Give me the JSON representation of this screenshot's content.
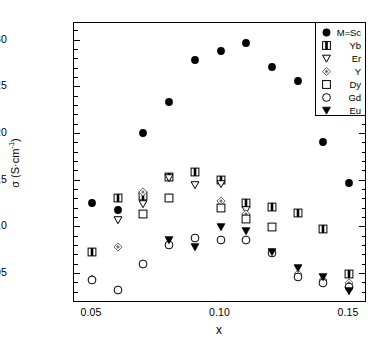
{
  "chart_data": {
    "type": "scatter",
    "title": "",
    "xlabel": "x",
    "ylabel": "σ (S·cm⁻¹)",
    "xlim": [
      0.043,
      0.157
    ],
    "ylim": [
      0.018,
      0.318
    ],
    "xticks": [
      0.05,
      0.1,
      0.15
    ],
    "xticklabels": [
      "0.05",
      "0.10",
      "0.15"
    ],
    "xminor_step": 0.01,
    "yticks": [
      0.05,
      0.1,
      0.15,
      0.2,
      0.25,
      0.3
    ],
    "yticklabels": [
      "0.05",
      "0.10",
      "0.15",
      "0.20",
      "0.25",
      "0.30"
    ],
    "yminor_step": 0.01,
    "grid": false,
    "legend_position": "top-right",
    "series": [
      {
        "name": "M=Sc",
        "marker": "filled-circle",
        "color": "#000000",
        "x": [
          0.05,
          0.06,
          0.07,
          0.08,
          0.09,
          0.1,
          0.11,
          0.12,
          0.13,
          0.14,
          0.15
        ],
        "y": [
          0.125,
          0.118,
          0.2,
          0.233,
          0.278,
          0.288,
          0.297,
          0.271,
          0.256,
          0.19,
          0.147
        ]
      },
      {
        "name": "Yb",
        "marker": "half-filled-square",
        "color": "#000000",
        "x": [
          0.05,
          0.06,
          0.07,
          0.08,
          0.09,
          0.1,
          0.11,
          0.12,
          0.13,
          0.14,
          0.15
        ],
        "y": [
          0.073,
          0.131,
          0.133,
          0.153,
          0.158,
          0.15,
          0.125,
          0.121,
          0.114,
          0.097,
          0.049
        ]
      },
      {
        "name": "Er",
        "marker": "open-triangle-down",
        "color": "#000000",
        "x": [
          0.06,
          0.07,
          0.08,
          0.09,
          0.1,
          0.11
        ],
        "y": [
          0.107,
          0.124,
          0.152,
          0.144,
          0.145,
          0.118
        ]
      },
      {
        "name": "Y",
        "marker": "dotted-diamond",
        "color": "#000000",
        "x": [
          0.05,
          0.06,
          0.07,
          0.08,
          0.1,
          0.11,
          0.13,
          0.14,
          0.15
        ],
        "y": [
          0.044,
          0.078,
          0.137,
          0.131,
          0.127,
          0.113,
          0.049,
          0.043,
          0.039
        ]
      },
      {
        "name": "Dy",
        "marker": "open-square",
        "color": "#000000",
        "x": [
          0.07,
          0.08,
          0.1,
          0.11,
          0.12
        ],
        "y": [
          0.113,
          0.131,
          0.12,
          0.108,
          0.099
        ]
      },
      {
        "name": "Gd",
        "marker": "open-circle",
        "color": "#000000",
        "x": [
          0.05,
          0.06,
          0.07,
          0.08,
          0.09,
          0.1,
          0.11,
          0.12,
          0.13,
          0.14,
          0.15
        ],
        "y": [
          0.043,
          0.032,
          0.06,
          0.08,
          0.088,
          0.086,
          0.085,
          0.072,
          0.046,
          0.039,
          0.035
        ]
      },
      {
        "name": "Eu",
        "marker": "filled-triangle-down",
        "color": "#000000",
        "x": [
          0.08,
          0.09,
          0.1,
          0.11,
          0.12,
          0.13,
          0.14,
          0.15
        ],
        "y": [
          0.085,
          0.078,
          0.099,
          0.095,
          0.073,
          0.055,
          0.046,
          0.031
        ]
      }
    ]
  },
  "legend": {
    "entries": [
      {
        "label": "M=Sc",
        "marker": "filled-circle"
      },
      {
        "label": "Yb",
        "marker": "half-filled-square"
      },
      {
        "label": "Er",
        "marker": "open-triangle-down"
      },
      {
        "label": "Y",
        "marker": "dotted-diamond"
      },
      {
        "label": "Dy",
        "marker": "open-square"
      },
      {
        "label": "Gd",
        "marker": "open-circle"
      },
      {
        "label": "Eu",
        "marker": "filled-triangle-down"
      }
    ]
  },
  "axes": {
    "y_title_main": "σ (S·cm",
    "y_title_sup": "-1",
    "y_title_close": ")",
    "x_title": "x"
  }
}
